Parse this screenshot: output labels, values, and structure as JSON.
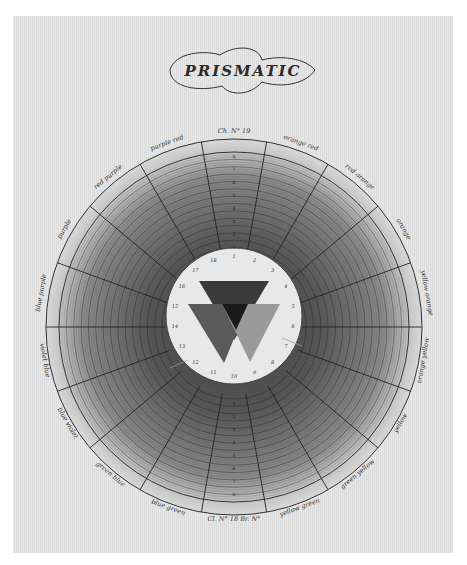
{
  "plate": {
    "title": "PRISMATIC",
    "top_caption": "Ch. N° 19",
    "bottom_caption": "Cl. N° 18 Br. N°"
  },
  "wheel": {
    "center": [
      234,
      327
    ],
    "outer_radius": 188,
    "label_ring_radius": 175,
    "inner_radius": 68,
    "segment_count": 18,
    "ring_count": 14,
    "segments": [
      {
        "label": "Ch. N° 19",
        "angle": 0
      },
      {
        "label": "orange red",
        "angle": 20
      },
      {
        "label": "red orange",
        "angle": 40
      },
      {
        "label": "orange",
        "angle": 60
      },
      {
        "label": "yellow orange",
        "angle": 80
      },
      {
        "label": "orange yellow",
        "angle": 100
      },
      {
        "label": "yellow",
        "angle": 120
      },
      {
        "label": "green yellow",
        "angle": 140
      },
      {
        "label": "yellow green",
        "angle": 160
      },
      {
        "label": "Cl. N° 18 Br. N°",
        "angle": 180
      },
      {
        "label": "blue green",
        "angle": 200
      },
      {
        "label": "green blue",
        "angle": 220
      },
      {
        "label": "blue violet",
        "angle": 240
      },
      {
        "label": "violet blue",
        "angle": 260
      },
      {
        "label": "blue purple",
        "angle": 280
      },
      {
        "label": "purple",
        "angle": 300
      },
      {
        "label": "red purple",
        "angle": 320
      },
      {
        "label": "purple red",
        "angle": 340
      }
    ],
    "inner_numbers": [
      "1",
      "2",
      "3",
      "4",
      "5",
      "6",
      "7",
      "8",
      "9",
      "10",
      "11",
      "12",
      "13",
      "14",
      "15",
      "16",
      "17",
      "18"
    ],
    "ring_numbers": [
      "1",
      "2",
      "3",
      "4",
      "5",
      "6",
      "7",
      "8"
    ]
  },
  "triangles": [
    {
      "name": "top",
      "points": "199,281 269,281 234,340",
      "color": "#3a3a3a"
    },
    {
      "name": "left",
      "points": "188,304 248,304 224,363",
      "color": "#5a5a5a"
    },
    {
      "name": "right",
      "points": "222,304 280,304 250,362",
      "color": "#9a9a9a"
    },
    {
      "name": "overlap",
      "points": "222,304 248,304 236,330",
      "color": "#1a1a1a"
    }
  ],
  "colors": {
    "paper": "#e4e4e4",
    "ink": "#2a2a2a",
    "ring_light": "#cfcfcf",
    "ring_dark": "#5c5c5c",
    "inner_disc": "#e8e8e8"
  }
}
